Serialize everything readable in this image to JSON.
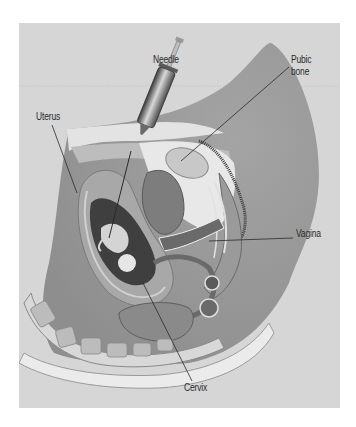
{
  "figure": {
    "labels": {
      "needle": "Needle",
      "pubic_bone_line1": "Pubic",
      "pubic_bone_line2": "bone",
      "uterus": "Uterus",
      "vagina": "Vagina",
      "cervix": "Cervix"
    },
    "colors": {
      "background": "#ffffff",
      "frame": "#d6d6d6",
      "body_outer": "#a9a9a9",
      "tissue_light": "#e6e6e6",
      "tissue_mid": "#8c8c8c",
      "tissue_dark": "#4a4a4a",
      "leader_line": "#2a2a2a"
    }
  }
}
